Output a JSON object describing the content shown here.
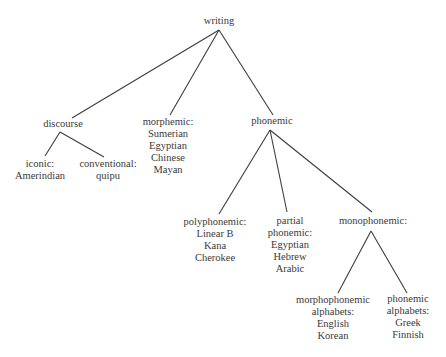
{
  "diagram": {
    "type": "tree",
    "root": "writing",
    "nodes": {
      "writing": {
        "lines": [
          "writing"
        ]
      },
      "discourse": {
        "lines": [
          "discourse"
        ]
      },
      "morphemic": {
        "lines": [
          "morphemic:",
          "Sumerian",
          "Egyptian",
          "Chinese",
          "Mayan"
        ]
      },
      "phonemic": {
        "lines": [
          "phonemic"
        ]
      },
      "iconic": {
        "lines": [
          "iconic:",
          "Amerindian"
        ]
      },
      "conventional": {
        "lines": [
          "conventional:",
          "quipu"
        ]
      },
      "polyphonemic": {
        "lines": [
          "polyphonemic:",
          "Linear B",
          "Kana",
          "Cherokee"
        ]
      },
      "partial_phonemic": {
        "lines": [
          "partial",
          "phonemic:",
          "Egyptian",
          "Hebrew",
          "Arabic"
        ]
      },
      "monophonemic": {
        "lines": [
          "monophonemic:"
        ]
      },
      "morphophonemic_alphabets": {
        "lines": [
          "morphophonemic",
          "alphabets:",
          "English",
          "Korean"
        ]
      },
      "phonemic_alphabets": {
        "lines": [
          "phonemic",
          "alphabets:",
          "Greek",
          "Finnish"
        ]
      }
    },
    "edges": [
      [
        "writing",
        "discourse"
      ],
      [
        "writing",
        "morphemic"
      ],
      [
        "writing",
        "phonemic"
      ],
      [
        "discourse",
        "iconic"
      ],
      [
        "discourse",
        "conventional"
      ],
      [
        "phonemic",
        "polyphonemic"
      ],
      [
        "phonemic",
        "partial_phonemic"
      ],
      [
        "phonemic",
        "monophonemic"
      ],
      [
        "monophonemic",
        "morphophonemic_alphabets"
      ],
      [
        "monophonemic",
        "phonemic_alphabets"
      ]
    ]
  }
}
